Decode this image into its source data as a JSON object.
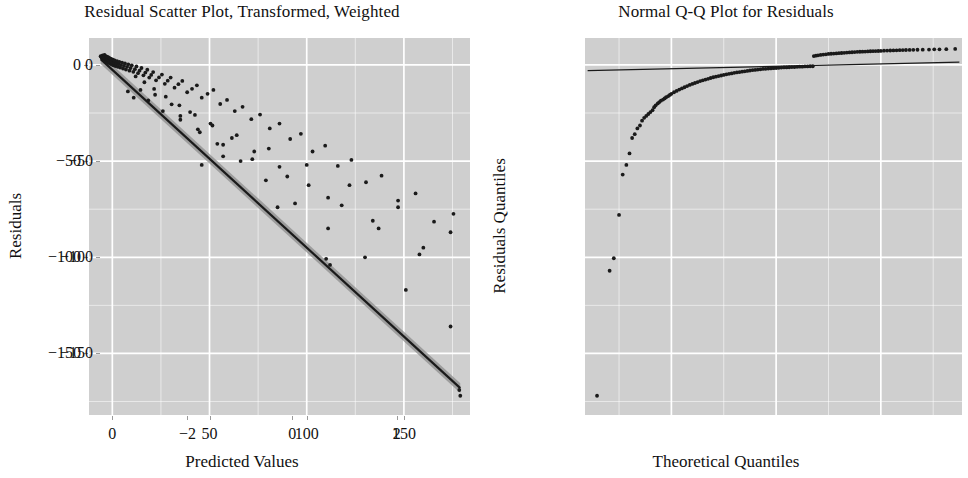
{
  "figure": {
    "background": "#ffffff",
    "panel_background": "#cfcfcf",
    "grid_color": "#ffffff",
    "point_color": "#1a1a1a",
    "line_color": "#1a1a1a",
    "band_color": "#8c8c8c",
    "width": 968,
    "height": 478
  },
  "chart_data": [
    {
      "type": "scatter",
      "id": "residual-scatter",
      "title": "Residual Scatter Plot, Transformed, Weighted",
      "xlabel": "Predicted Values",
      "ylabel": "Residuals",
      "xlim": [
        -12,
        184
      ],
      "ylim": [
        -182,
        14
      ],
      "xticks": [
        0,
        50,
        100,
        150
      ],
      "xtick_labels": [
        "0",
        "50",
        "100",
        "150"
      ],
      "yticks": [
        0,
        -50,
        -100,
        -150
      ],
      "ytick_labels": [
        "0",
        "−50",
        "−100",
        "−150"
      ],
      "grid": true,
      "minor_grid": true,
      "legend": "none",
      "fit_line": {
        "description": "smoothed regression line with shaded confidence band",
        "x_start": -6,
        "y_start": 3,
        "x_end": 179,
        "y_end": -168,
        "band_halfwidth": 2.5
      },
      "points": [
        [
          -6.0,
          4.5
        ],
        [
          -5.6,
          4.0
        ],
        [
          -5.3,
          3.6
        ],
        [
          -5.0,
          5.0
        ],
        [
          -4.8,
          3.0
        ],
        [
          -4.6,
          4.2
        ],
        [
          -4.4,
          2.6
        ],
        [
          -4.2,
          3.9
        ],
        [
          -4.0,
          5.2
        ],
        [
          -3.8,
          2.2
        ],
        [
          -3.6,
          3.4
        ],
        [
          -3.4,
          4.6
        ],
        [
          -3.2,
          1.9
        ],
        [
          -3.0,
          3.1
        ],
        [
          -2.8,
          4.3
        ],
        [
          -2.6,
          1.5
        ],
        [
          -2.4,
          2.8
        ],
        [
          -2.2,
          4.0
        ],
        [
          -2.0,
          1.2
        ],
        [
          -1.8,
          2.4
        ],
        [
          -1.6,
          3.7
        ],
        [
          -1.4,
          0.9
        ],
        [
          -1.2,
          2.1
        ],
        [
          -1.0,
          3.3
        ],
        [
          -0.8,
          0.5
        ],
        [
          -0.6,
          1.8
        ],
        [
          -0.4,
          3.0
        ],
        [
          -0.2,
          0.2
        ],
        [
          0.0,
          1.4
        ],
        [
          0.3,
          2.7
        ],
        [
          0.6,
          -0.2
        ],
        [
          0.9,
          1.1
        ],
        [
          1.2,
          2.3
        ],
        [
          1.6,
          -0.6
        ],
        [
          2.0,
          0.7
        ],
        [
          2.4,
          1.9
        ],
        [
          2.8,
          -1.0
        ],
        [
          3.2,
          0.3
        ],
        [
          3.6,
          1.6
        ],
        [
          4.0,
          -1.4
        ],
        [
          4.5,
          -0.1
        ],
        [
          5.0,
          1.2
        ],
        [
          5.5,
          -1.9
        ],
        [
          6.0,
          -0.5
        ],
        [
          6.5,
          0.8
        ],
        [
          7.0,
          -2.4
        ],
        [
          7.6,
          -1.0
        ],
        [
          8.2,
          0.3
        ],
        [
          8.8,
          -3.0
        ],
        [
          9.4,
          -1.6
        ],
        [
          10.0,
          -0.2
        ],
        [
          10.8,
          -3.6
        ],
        [
          11.6,
          -2.2
        ],
        [
          12.4,
          -0.8
        ],
        [
          13.2,
          -4.3
        ],
        [
          14.0,
          -3.0
        ],
        [
          15.0,
          -1.6
        ],
        [
          16.0,
          -5.4
        ],
        [
          17.0,
          -4.0
        ],
        [
          18.0,
          -2.5
        ],
        [
          19.0,
          -6.6
        ],
        [
          20.0,
          -5.2
        ],
        [
          21.0,
          -3.7
        ],
        [
          22.5,
          -8.0
        ],
        [
          24.0,
          -6.5
        ],
        [
          25.5,
          -5.0
        ],
        [
          27.0,
          -9.8
        ],
        [
          28.5,
          -8.2
        ],
        [
          30.0,
          -6.6
        ],
        [
          32.0,
          -11.8
        ],
        [
          34.0,
          -10.0
        ],
        [
          36.0,
          -8.3
        ],
        [
          38.5,
          -14.2
        ],
        [
          41.0,
          -12.4
        ],
        [
          43.5,
          -10.6
        ],
        [
          46.0,
          -17.0
        ],
        [
          49.0,
          -15.0
        ],
        [
          52.0,
          -13.0
        ],
        [
          55.5,
          -20.3
        ],
        [
          59.0,
          -18.2
        ],
        [
          63.0,
          -24.0
        ],
        [
          67.0,
          -21.8
        ],
        [
          71.5,
          -28.2
        ],
        [
          76.0,
          -25.8
        ],
        [
          81.0,
          -33.0
        ],
        [
          86.0,
          -30.5
        ],
        [
          91.5,
          -38.5
        ],
        [
          97.0,
          -35.8
        ],
        [
          103.0,
          -45.0
        ],
        [
          109.5,
          -42.0
        ],
        [
          116.0,
          -52.5
        ],
        [
          123.0,
          -49.4
        ],
        [
          130.5,
          -61.0
        ],
        [
          138.5,
          -57.6
        ],
        [
          147.0,
          -70.5
        ],
        [
          156.0,
          -66.8
        ],
        [
          165.5,
          -81.5
        ],
        [
          175.5,
          -77.4
        ],
        [
          8.0,
          -13.8
        ],
        [
          11.0,
          -17.0
        ],
        [
          14.5,
          -13.0
        ],
        [
          18.5,
          -18.5
        ],
        [
          22.0,
          -15.5
        ],
        [
          26.0,
          -24.0
        ],
        [
          30.5,
          -20.5
        ],
        [
          35.0,
          -28.5
        ],
        [
          40.0,
          -24.5
        ],
        [
          45.0,
          -35.0
        ],
        [
          50.5,
          -30.5
        ],
        [
          57.0,
          -41.5
        ],
        [
          64.0,
          -36.5
        ],
        [
          72.0,
          -49.0
        ],
        [
          80.5,
          -43.5
        ],
        [
          90.0,
          -58.0
        ],
        [
          100.0,
          -52.0
        ],
        [
          111.0,
          -69.0
        ],
        [
          122.0,
          -62.5
        ],
        [
          134.0,
          -81.0
        ],
        [
          147.0,
          -74.0
        ],
        [
          160.0,
          -95.0
        ],
        [
          174.0,
          -87.0
        ],
        [
          12.0,
          -6.0
        ],
        [
          16.5,
          -9.0
        ],
        [
          21.5,
          -12.5
        ],
        [
          27.5,
          -16.5
        ],
        [
          34.5,
          -21.0
        ],
        [
          42.5,
          -26.0
        ],
        [
          51.5,
          -31.5
        ],
        [
          61.5,
          -38.0
        ],
        [
          73.0,
          -45.0
        ],
        [
          86.0,
          -53.0
        ],
        [
          101.0,
          -62.5
        ],
        [
          118.0,
          -73.0
        ],
        [
          137.0,
          -85.0
        ],
        [
          158.0,
          -98.5
        ],
        [
          35.0,
          -26.5
        ],
        [
          44.0,
          -33.5
        ],
        [
          54.0,
          -41.0
        ],
        [
          66.0,
          -50.0
        ],
        [
          79.0,
          -60.0
        ],
        [
          94.0,
          -72.0
        ],
        [
          111.0,
          -85.0
        ],
        [
          130.0,
          -100.0
        ],
        [
          151.0,
          -117.0
        ],
        [
          174.0,
          -136.0
        ],
        [
          110.0,
          -100.8
        ],
        [
          112.0,
          -104.0
        ],
        [
          178.5,
          -169.0
        ],
        [
          179.0,
          -172.0
        ],
        [
          46.0,
          -52.0
        ],
        [
          57.0,
          -47.5
        ],
        [
          85.0,
          -74.0
        ]
      ]
    },
    {
      "type": "scatter",
      "id": "normal-qq",
      "title": "Normal Q-Q Plot for Residuals",
      "xlabel": "Theoretical Quantiles",
      "ylabel": "Residuals Quantiles",
      "xlim": [
        -3.65,
        3.55
      ],
      "ylim": [
        -182,
        14
      ],
      "xticks": [
        -2,
        0,
        2
      ],
      "xtick_labels": [
        "−2",
        "0",
        "2"
      ],
      "yticks": [
        0,
        -50,
        -100,
        -150
      ],
      "ytick_labels": [
        "0",
        "−50",
        "−100",
        "−150"
      ],
      "grid": true,
      "minor_grid": true,
      "legend": "none",
      "reference_line": {
        "description": "theoretical normal reference line, nearly flat",
        "x_start": -3.6,
        "y_start": -3.0,
        "x_end": 3.5,
        "y_end": 1.5
      },
      "points": [
        [
          -3.42,
          -172.0
        ],
        [
          -3.18,
          -107.0
        ],
        [
          -3.1,
          -100.5
        ],
        [
          -3.0,
          -78.0
        ],
        [
          -2.93,
          -57.0
        ],
        [
          -2.86,
          -52.0
        ],
        [
          -2.8,
          -46.0
        ],
        [
          -2.75,
          -38.0
        ],
        [
          -2.7,
          -36.0
        ],
        [
          -2.65,
          -33.0
        ],
        [
          -2.6,
          -31.5
        ],
        [
          -2.56,
          -29.0
        ],
        [
          -2.52,
          -27.5
        ],
        [
          -2.48,
          -26.5
        ],
        [
          -2.44,
          -25.5
        ],
        [
          -2.4,
          -24.5
        ],
        [
          -2.36,
          -23.5
        ],
        [
          -2.33,
          -22.0
        ],
        [
          -2.3,
          -21.0
        ],
        [
          -2.26,
          -20.0
        ],
        [
          -2.23,
          -19.3
        ],
        [
          -2.2,
          -18.6
        ],
        [
          -2.16,
          -18.0
        ],
        [
          -2.13,
          -17.4
        ],
        [
          -2.1,
          -16.8
        ],
        [
          -2.06,
          -16.2
        ],
        [
          -2.03,
          -15.6
        ],
        [
          -2.0,
          -15.0
        ],
        [
          -1.95,
          -14.2
        ],
        [
          -1.9,
          -13.5
        ],
        [
          -1.85,
          -12.8
        ],
        [
          -1.8,
          -12.2
        ],
        [
          -1.75,
          -11.6
        ],
        [
          -1.7,
          -11.0
        ],
        [
          -1.65,
          -10.4
        ],
        [
          -1.6,
          -9.9
        ],
        [
          -1.55,
          -9.4
        ],
        [
          -1.5,
          -8.9
        ],
        [
          -1.45,
          -8.4
        ],
        [
          -1.4,
          -8.0
        ],
        [
          -1.35,
          -7.6
        ],
        [
          -1.3,
          -7.2
        ],
        [
          -1.25,
          -6.8
        ],
        [
          -1.2,
          -6.4
        ],
        [
          -1.15,
          -6.1
        ],
        [
          -1.1,
          -5.8
        ],
        [
          -1.05,
          -5.5
        ],
        [
          -1.0,
          -5.2
        ],
        [
          -0.95,
          -4.9
        ],
        [
          -0.9,
          -4.6
        ],
        [
          -0.85,
          -4.4
        ],
        [
          -0.8,
          -4.1
        ],
        [
          -0.75,
          -3.9
        ],
        [
          -0.7,
          -3.7
        ],
        [
          -0.65,
          -3.5
        ],
        [
          -0.6,
          -3.3
        ],
        [
          -0.55,
          -3.1
        ],
        [
          -0.5,
          -2.9
        ],
        [
          -0.45,
          -2.7
        ],
        [
          -0.4,
          -2.6
        ],
        [
          -0.35,
          -2.4
        ],
        [
          -0.3,
          -2.3
        ],
        [
          -0.25,
          -2.1
        ],
        [
          -0.2,
          -2.0
        ],
        [
          -0.15,
          -1.9
        ],
        [
          -0.1,
          -1.8
        ],
        [
          -0.05,
          -1.7
        ],
        [
          0.0,
          -1.6
        ],
        [
          0.05,
          -1.5
        ],
        [
          0.1,
          -1.4
        ],
        [
          0.15,
          -1.3
        ],
        [
          0.2,
          -1.3
        ],
        [
          0.25,
          -1.2
        ],
        [
          0.3,
          -1.1
        ],
        [
          0.35,
          -1.1
        ],
        [
          0.4,
          -1.0
        ],
        [
          0.45,
          -0.9
        ],
        [
          0.5,
          -0.9
        ],
        [
          0.55,
          -0.8
        ],
        [
          0.6,
          -0.8
        ],
        [
          0.65,
          -0.7
        ],
        [
          0.7,
          -0.7
        ],
        [
          0.72,
          4.6
        ],
        [
          0.76,
          4.8
        ],
        [
          0.8,
          5.0
        ],
        [
          0.85,
          5.2
        ],
        [
          0.9,
          5.4
        ],
        [
          0.95,
          5.5
        ],
        [
          1.0,
          5.7
        ],
        [
          1.05,
          5.8
        ],
        [
          1.1,
          5.9
        ],
        [
          1.15,
          6.0
        ],
        [
          1.2,
          6.1
        ],
        [
          1.25,
          6.2
        ],
        [
          1.3,
          6.3
        ],
        [
          1.35,
          6.4
        ],
        [
          1.4,
          6.5
        ],
        [
          1.45,
          6.6
        ],
        [
          1.5,
          6.7
        ],
        [
          1.55,
          6.8
        ],
        [
          1.6,
          6.85
        ],
        [
          1.65,
          6.9
        ],
        [
          1.7,
          6.95
        ],
        [
          1.75,
          7.0
        ],
        [
          1.8,
          7.1
        ],
        [
          1.85,
          7.15
        ],
        [
          1.9,
          7.2
        ],
        [
          1.95,
          7.25
        ],
        [
          2.0,
          7.3
        ],
        [
          2.06,
          7.4
        ],
        [
          2.12,
          7.45
        ],
        [
          2.18,
          7.5
        ],
        [
          2.24,
          7.55
        ],
        [
          2.3,
          7.6
        ],
        [
          2.36,
          7.65
        ],
        [
          2.42,
          7.7
        ],
        [
          2.48,
          7.75
        ],
        [
          2.55,
          7.8
        ],
        [
          2.62,
          7.85
        ],
        [
          2.7,
          7.9
        ],
        [
          2.8,
          7.95
        ],
        [
          2.92,
          8.0
        ],
        [
          3.02,
          8.1
        ],
        [
          3.12,
          8.1
        ],
        [
          3.25,
          8.2
        ],
        [
          3.42,
          8.3
        ]
      ]
    }
  ]
}
